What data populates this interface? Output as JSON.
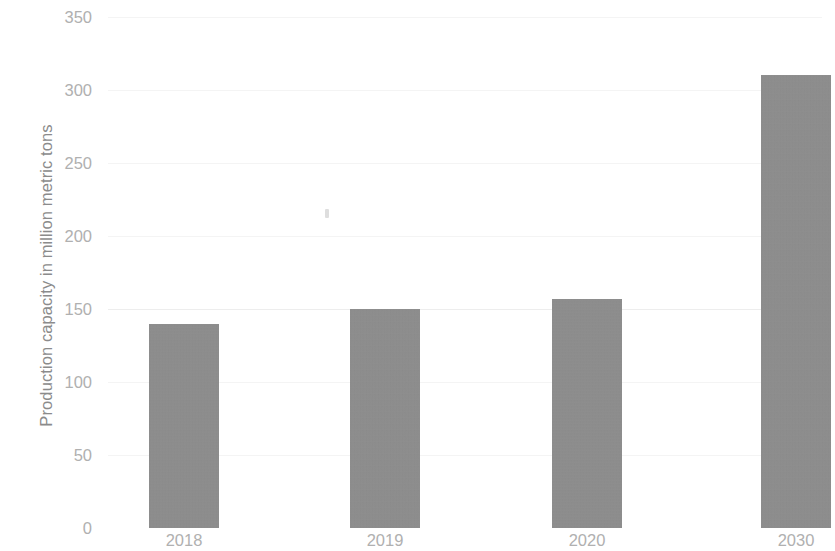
{
  "chart_data": {
    "type": "bar",
    "title": "",
    "xlabel": "",
    "ylabel": "Production capacity in million metric tons",
    "categories": [
      "2018",
      "2019",
      "2020",
      "2030"
    ],
    "values": [
      140,
      150,
      157,
      310
    ],
    "series": [
      {
        "name": "Production capacity",
        "values": [
          140,
          150,
          157,
          310
        ]
      }
    ],
    "ylim": [
      0,
      350
    ],
    "ytick_labels": [
      "0",
      "50",
      "100",
      "150",
      "200",
      "250",
      "300",
      "350"
    ],
    "ytick_values": [
      0,
      50,
      100,
      150,
      200,
      250,
      300,
      350
    ],
    "grid": true,
    "grid_axis": "y",
    "legend": false,
    "legend_position": "none",
    "bar_color": "#8d8d8d",
    "gridline_color": "#f2f2f2",
    "tick_label_color": "#b0b0b0",
    "axis_title_color": "#8b8b8b",
    "background_color": "#ffffff"
  }
}
